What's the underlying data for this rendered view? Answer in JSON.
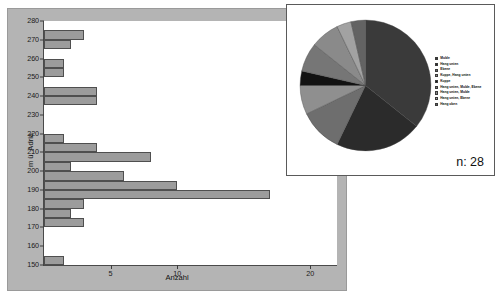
{
  "histogram": {
    "y_axis_title": "m ü. Adria",
    "x_axis_title": "Anzahl",
    "y_ticks": [
      "280",
      "270",
      "260",
      "250",
      "240",
      "230",
      "220",
      "210",
      "200",
      "190",
      "180",
      "170",
      "160",
      "150"
    ],
    "x_ticks": [
      "5",
      "10",
      "20"
    ]
  },
  "pie": {
    "n_label": "n: 28",
    "legend": [
      {
        "label": "Mulde",
        "color": "#3a3a3a"
      },
      {
        "label": "Hang unten",
        "color": "#2b2b2b"
      },
      {
        "label": "Ebene",
        "color": "#6e6e6e"
      },
      {
        "label": "Kuppe, Hang unten",
        "color": "#8f8f8f"
      },
      {
        "label": "Kuppe",
        "color": "#121212"
      },
      {
        "label": "Hang unten, Mulde, Ebene",
        "color": "#767676"
      },
      {
        "label": "Hang unten, Mulde",
        "color": "#8a8a8a"
      },
      {
        "label": "Hang unten, Ebene",
        "color": "#a2a2a2"
      },
      {
        "label": "Hang oben",
        "color": "#636363"
      }
    ]
  },
  "chart_data": [
    {
      "type": "bar",
      "orientation": "horizontal",
      "title": "",
      "xlabel": "Anzahl",
      "ylabel": "m ü. Adria",
      "xlim": [
        0,
        22
      ],
      "ylim": [
        150,
        280
      ],
      "bin_width": 5,
      "grid": false,
      "categories": [
        "150-155",
        "155-160",
        "160-165",
        "165-170",
        "170-175",
        "175-180",
        "180-185",
        "185-190",
        "190-195",
        "195-200",
        "200-205",
        "205-210",
        "210-215",
        "215-220",
        "220-225",
        "225-230",
        "230-235",
        "235-240",
        "240-245",
        "245-250",
        "250-255",
        "255-260",
        "260-265",
        "265-270",
        "270-275",
        "275-280"
      ],
      "values": [
        1.5,
        0,
        0,
        0,
        3,
        2,
        3,
        17,
        10,
        6,
        2,
        8,
        4,
        1.5,
        0,
        0,
        0,
        4,
        4,
        0,
        1.5,
        1.5,
        0,
        2,
        3,
        0
      ],
      "bar_color": "#9c9c9c",
      "x_tick_values": [
        5,
        10,
        20
      ],
      "y_tick_values": [
        150,
        160,
        170,
        180,
        190,
        200,
        210,
        220,
        230,
        240,
        250,
        260,
        270,
        280
      ]
    },
    {
      "type": "pie",
      "title": "",
      "n": 28,
      "n_label": "n: 28",
      "legend_position": "right",
      "labels": [
        "Mulde",
        "Hang unten",
        "Ebene",
        "Kuppe, Hang unten",
        "Kuppe",
        "Hang unten, Mulde, Ebene",
        "Hang unten, Mulde",
        "Hang unten, Ebene",
        "Hang oben"
      ],
      "values": [
        10,
        6,
        3,
        2,
        1,
        2,
        2,
        1,
        1
      ],
      "colors": [
        "#3a3a3a",
        "#2b2b2b",
        "#6e6e6e",
        "#8f8f8f",
        "#121212",
        "#767676",
        "#8a8a8a",
        "#a2a2a2",
        "#636363"
      ]
    }
  ]
}
